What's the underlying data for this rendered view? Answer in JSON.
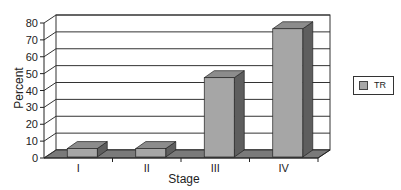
{
  "chart_data": {
    "type": "bar",
    "style": "3d-column",
    "title": "",
    "xlabel": "Stage",
    "ylabel": "Percent",
    "categories": [
      "I",
      "II",
      "III",
      "IV"
    ],
    "series": [
      {
        "name": "TR",
        "values": [
          5,
          5,
          47,
          76
        ]
      }
    ],
    "ylim": [
      0,
      80
    ],
    "yticks": [
      0,
      10,
      20,
      30,
      40,
      50,
      60,
      70,
      80
    ],
    "grid": true,
    "legend_position": "right"
  },
  "colors": {
    "bar_front": "#a6a6a6",
    "bar_top": "#8c8c8c",
    "bar_side": "#5e5e5e",
    "floor": "#7a7a7a",
    "grid": "#333333",
    "axis": "#222222"
  },
  "legend": {
    "label": "TR"
  }
}
